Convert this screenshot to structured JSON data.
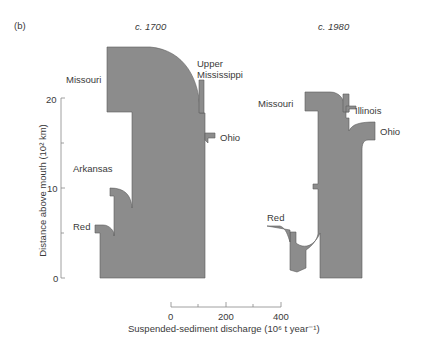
{
  "panel_label": "(b)",
  "diagrams": [
    {
      "title": "c. 1700",
      "tributaries": [
        "Missouri",
        "Upper Mississippi",
        "Ohio",
        "Arkansas",
        "Red"
      ]
    },
    {
      "title": "c. 1980",
      "tributaries": [
        "Missouri",
        "Illinois",
        "Ohio",
        "Red"
      ]
    }
  ],
  "labels": {
    "t1700": "c. 1700",
    "t1980": "c. 1980",
    "missouri_1700": "Missouri",
    "upper": "Upper",
    "mississippi": "Mississippi",
    "ohio_1700": "Ohio",
    "arkansas": "Arkansas",
    "red_1700": "Red",
    "missouri_1980": "Missouri",
    "illinois": "Illinois",
    "ohio_1980": "Ohio",
    "red_1980": "Red"
  },
  "y_axis": {
    "label": "Distance above mouth (10² km)",
    "ticks": [
      "0",
      "10",
      "20"
    ]
  },
  "x_axis": {
    "label": "Suspended-sediment discharge (10⁶ t year⁻¹)",
    "ticks": [
      "0",
      "200",
      "400"
    ]
  },
  "colors": {
    "fill": "#8c8c8c",
    "stroke": "#555555",
    "axis": "#777777"
  }
}
